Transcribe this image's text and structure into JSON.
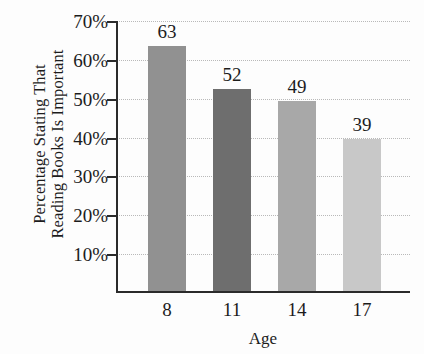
{
  "chart_data": {
    "type": "bar",
    "title": "",
    "xlabel": "Age",
    "ylabel_lines": [
      "Percentage Stating That",
      "Reading Books Is Important"
    ],
    "categories": [
      "8",
      "11",
      "14",
      "17"
    ],
    "values": [
      63,
      52,
      49,
      39
    ],
    "value_labels": [
      "63",
      "52",
      "49",
      "39"
    ],
    "ylim": [
      0,
      70
    ],
    "ytick_values": [
      10,
      20,
      30,
      40,
      50,
      60,
      70
    ],
    "ytick_labels": [
      "10%",
      "20%",
      "30%",
      "40%",
      "50%",
      "60%",
      "70%"
    ],
    "grid": true,
    "grid_axis": "y",
    "grid_style": "dotted",
    "legend": "none",
    "bar_colors": [
      "#919191",
      "#6e6e6e",
      "#a8a8a8",
      "#c8c8c8"
    ],
    "series": [
      {
        "name": "Percentage Stating That Reading Books Is Important",
        "values": [
          63,
          52,
          49,
          39
        ]
      }
    ]
  },
  "colors": {
    "background": "#fdfdfd",
    "axis": "#2b2b2b",
    "gridline": "#b9b9b9",
    "text": "#1c1c1c"
  }
}
